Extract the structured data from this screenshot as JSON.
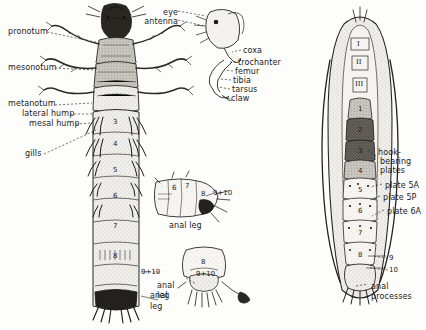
{
  "plate": {
    "title": "Hellgrammite larva and pupa anatomical plate",
    "background_color": "#fdfdfc",
    "ink_color": "#1b1b1b"
  },
  "figures": {
    "larva_dorsal": {
      "name": "larva-dorsal-view",
      "labels": [
        {
          "id": "pronotum",
          "text": "pronotum",
          "x": 8,
          "y": 29,
          "align": "left"
        },
        {
          "id": "mesonotum",
          "text": "mesonotum",
          "x": 8,
          "y": 65,
          "align": "left"
        },
        {
          "id": "metanotum",
          "text": "metanotum",
          "x": 8,
          "y": 102,
          "align": "left"
        },
        {
          "id": "lateral_hump",
          "text": "lateral hump",
          "x": 22,
          "y": 112,
          "align": "left"
        },
        {
          "id": "mesal_hump",
          "text": "mesal hump",
          "x": 28,
          "y": 122,
          "align": "left"
        },
        {
          "id": "gills",
          "text": "gills",
          "x": 24,
          "y": 152,
          "align": "left"
        }
      ],
      "segment_numbers": [
        "3",
        "4",
        "5",
        "6",
        "7",
        "8"
      ],
      "terminal_label": "9+10",
      "anal_leg_label_line1": "anal",
      "anal_leg_label_line2": "leg"
    },
    "leg_detail": {
      "name": "leg-and-head-detail",
      "labels": [
        {
          "id": "eye",
          "text": "eye",
          "x": 170,
          "y": 11,
          "align": "right"
        },
        {
          "id": "antenna",
          "text": "antenna",
          "x": 161,
          "y": 20,
          "align": "right"
        },
        {
          "id": "coxa",
          "text": "coxa",
          "x": 243,
          "y": 49,
          "align": "left"
        },
        {
          "id": "trochanter",
          "text": "trochanter",
          "x": 238,
          "y": 61,
          "align": "left"
        },
        {
          "id": "femur",
          "text": "femur",
          "x": 235,
          "y": 70,
          "align": "left"
        },
        {
          "id": "tibia",
          "text": "tibia",
          "x": 233,
          "y": 79,
          "align": "left"
        },
        {
          "id": "tarsus",
          "text": "tarsus",
          "x": 232,
          "y": 88,
          "align": "left"
        },
        {
          "id": "claw",
          "text": "claw",
          "x": 231,
          "y": 97,
          "align": "left"
        }
      ]
    },
    "abdomen_lateral": {
      "name": "abdomen-lateral-detail",
      "segment_numbers": [
        {
          "text": "6",
          "x": 172,
          "y": 186
        },
        {
          "text": "7",
          "x": 185,
          "y": 184
        },
        {
          "text": "8",
          "x": 201,
          "y": 192
        },
        {
          "text": "9+10",
          "x": 213,
          "y": 191
        }
      ],
      "caption": "anal leg"
    },
    "abdomen_ventral": {
      "name": "abdomen-ventral-detail",
      "segment_numbers": [
        {
          "text": "8",
          "x": 206,
          "y": 262
        },
        {
          "text": "9+10",
          "x": 203,
          "y": 273
        }
      ],
      "caption_line1": "anal",
      "caption_line2": "leg"
    },
    "pupa": {
      "name": "pupa-ventral-view",
      "thoracic_segments": [
        "I",
        "II",
        "III"
      ],
      "abdominal_segments": [
        "1",
        "2",
        "3",
        "4",
        "5",
        "6",
        "7",
        "8"
      ],
      "labels": [
        {
          "id": "hook_bearing_plates_l1",
          "text": "hook-",
          "x": 378,
          "y": 151
        },
        {
          "id": "hook_bearing_plates_l2",
          "text": "bearing",
          "x": 380,
          "y": 160
        },
        {
          "id": "hook_bearing_plates_l3",
          "text": "plates",
          "x": 380,
          "y": 169
        },
        {
          "id": "plate_5a",
          "text": "plate 5A",
          "x": 385,
          "y": 184
        },
        {
          "id": "plate_5p",
          "text": "plate 5P",
          "x": 383,
          "y": 196
        },
        {
          "id": "plate_6a",
          "text": "plate 6A",
          "x": 387,
          "y": 210
        }
      ],
      "terminal_numbers": [
        {
          "text": "9",
          "x": 391,
          "y": 258
        },
        {
          "text": "10",
          "x": 391,
          "y": 270
        }
      ],
      "caption_line1": "anal",
      "caption_line2": "processes"
    }
  }
}
